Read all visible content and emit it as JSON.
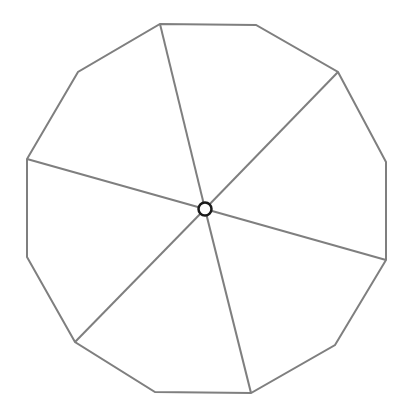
{
  "diagram": {
    "title": "",
    "type": "dodecagon-divided-into-sectors",
    "stroke_color": "#7f7f7f",
    "center_fill": "#ffffff",
    "center_stroke": "#1a1a1a",
    "center": [
      205,
      209
    ],
    "center_radius": 6.5,
    "polygon_vertices": [
      [
        160,
        24
      ],
      [
        256,
        25
      ],
      [
        338,
        72
      ],
      [
        386,
        162
      ],
      [
        386,
        260
      ],
      [
        335,
        345
      ],
      [
        251,
        393
      ],
      [
        155,
        392
      ],
      [
        75,
        342
      ],
      [
        27,
        257
      ],
      [
        27,
        159
      ],
      [
        78,
        72
      ]
    ],
    "spokes_to_vertices": [
      [
        160,
        24
      ],
      [
        338,
        72
      ],
      [
        386,
        260
      ],
      [
        251,
        393
      ],
      [
        75,
        342
      ],
      [
        27,
        159
      ]
    ],
    "sector_count": 6
  }
}
